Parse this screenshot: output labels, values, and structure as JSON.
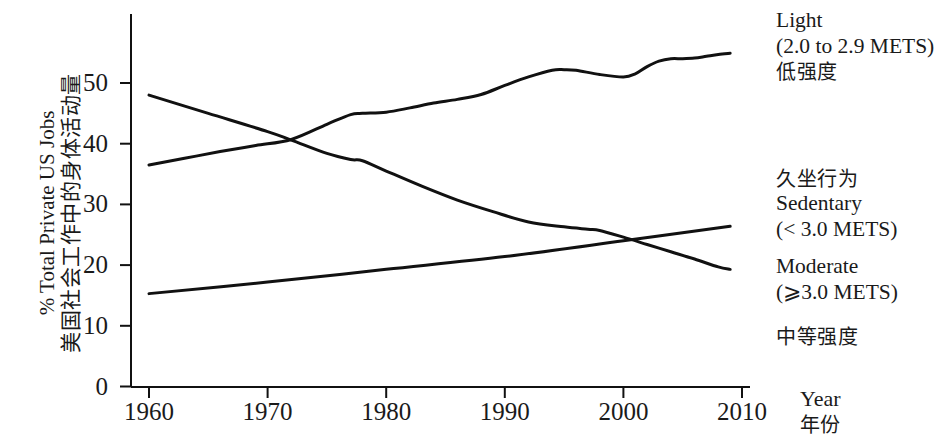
{
  "chart_data": {
    "type": "line",
    "title": "",
    "xlabel": "Year",
    "xlabel_cn": "年份",
    "ylabel": "% Total Private US Jobs",
    "ylabel_cn": "美国社会工作中的身体活动量",
    "ylabel_sup": "%",
    "xlim": [
      1958,
      2010
    ],
    "ylim": [
      0,
      58
    ],
    "xticks": [
      1960,
      1970,
      1980,
      1990,
      2000,
      2010
    ],
    "xtick_labels": [
      "1960",
      "1970",
      "1980",
      "1990",
      "2000",
      "2010"
    ],
    "yticks": [
      0,
      10,
      20,
      30,
      40,
      50
    ],
    "ytick_labels": [
      "0",
      "10",
      "20",
      "30",
      "40",
      "50"
    ],
    "grid": false,
    "legend_position": "right",
    "line_color": "#111111",
    "series": [
      {
        "name": "Light",
        "x": [
          1960,
          1963,
          1966,
          1969,
          1972,
          1975,
          1977,
          1978,
          1980,
          1982,
          1984,
          1986,
          1988,
          1990,
          1992,
          1994,
          1995,
          1996,
          1998,
          2000,
          2001,
          2002,
          2003,
          2004,
          2005,
          2006,
          2007,
          2008,
          2009
        ],
        "values": [
          36.5,
          37.6,
          38.7,
          39.7,
          40.7,
          43.2,
          44.8,
          45.0,
          45.2,
          45.9,
          46.7,
          47.3,
          48.1,
          49.6,
          51.0,
          52.1,
          52.2,
          52.1,
          51.4,
          51.0,
          51.5,
          52.7,
          53.6,
          54.0,
          54.0,
          54.1,
          54.4,
          54.7,
          54.9
        ]
      },
      {
        "name": "Sedentary",
        "x": [
          1960,
          1965,
          1970,
          1972,
          1975,
          1977,
          1978,
          1980,
          1983,
          1986,
          1989,
          1992,
          1995,
          1997,
          1998,
          2000,
          2002,
          2004,
          2006,
          2008,
          2009
        ],
        "values": [
          48.0,
          45.0,
          42.0,
          40.6,
          38.4,
          37.4,
          37.2,
          35.5,
          33.0,
          30.7,
          28.8,
          27.1,
          26.3,
          25.9,
          25.7,
          24.6,
          23.4,
          22.2,
          21.0,
          19.7,
          19.3
        ]
      },
      {
        "name": "Moderate",
        "x": [
          1960,
          1970,
          1980,
          1990,
          2000,
          2009
        ],
        "values": [
          15.3,
          17.2,
          19.3,
          21.4,
          24.0,
          26.4
        ]
      }
    ]
  },
  "legend": {
    "light": {
      "label_en": "Light",
      "label_mets": "(2.0 to 2.9 METS)",
      "label_cn": "低强度"
    },
    "sedentary": {
      "label_cn": "久坐行为",
      "label_en": "Sedentary",
      "label_mets": "(< 3.0 METS)"
    },
    "moderate": {
      "label_en": "Moderate",
      "label_mets": "(⩾3.0 METS)",
      "label_cn": "中等强度"
    }
  },
  "axis": {
    "x_title_en": "Year",
    "x_title_cn": "年份",
    "y_title_cn": "美国社会工作中的身体活动量",
    "y_title_en": "% Total Private US Jobs"
  }
}
